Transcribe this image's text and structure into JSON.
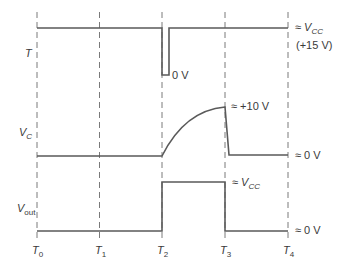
{
  "diagram": {
    "type": "timing-diagram",
    "time_markers": [
      {
        "label": "T",
        "sub": "0"
      },
      {
        "label": "T",
        "sub": "1"
      },
      {
        "label": "T",
        "sub": "2"
      },
      {
        "label": "T",
        "sub": "3"
      },
      {
        "label": "T",
        "sub": "4"
      }
    ],
    "signals": {
      "trigger": {
        "name": "T",
        "high_label_approx": "≈",
        "high_label_var": "V",
        "high_label_sub": "CC",
        "high_value": "(+15 V)",
        "low_label": "0 V"
      },
      "capacitor": {
        "name": "V",
        "name_sub": "C",
        "peak_label": "≈ +10 V",
        "low_label": "≈ 0 V"
      },
      "output": {
        "name": "V",
        "name_sub": "out",
        "high_label_approx": "≈",
        "high_label_var": "V",
        "high_label_sub": "CC",
        "low_label": "≈ 0 V"
      }
    },
    "colors": {
      "trace": "#5a5a5a",
      "grid": "#7a7a7a",
      "text": "#3a3a3a"
    }
  }
}
